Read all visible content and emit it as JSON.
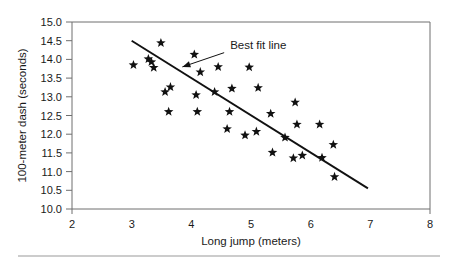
{
  "chart_data": {
    "type": "scatter",
    "title": "",
    "xlabel": "Long jump (meters)",
    "ylabel": "100-meter dash (seconds)",
    "xlim": [
      2,
      8
    ],
    "ylim": [
      10.0,
      15.0
    ],
    "xticks": [
      "2",
      "3",
      "4",
      "5",
      "6",
      "7",
      "8"
    ],
    "yticks": [
      "10.0",
      "10.5",
      "11.0",
      "11.5",
      "12.0",
      "12.5",
      "13.0",
      "13.5",
      "14.0",
      "14.5",
      "15.0"
    ],
    "grid": false,
    "legend": false,
    "marker_symbol": "star",
    "marker_color": "#111111",
    "series": [
      {
        "name": "Athletes",
        "points": [
          [
            3.03,
            13.85
          ],
          [
            3.28,
            14.01
          ],
          [
            3.33,
            13.93
          ],
          [
            3.37,
            13.78
          ],
          [
            3.49,
            14.44
          ],
          [
            3.56,
            13.13
          ],
          [
            3.62,
            12.6
          ],
          [
            3.65,
            13.26
          ],
          [
            4.05,
            14.13
          ],
          [
            4.08,
            13.05
          ],
          [
            4.1,
            12.6
          ],
          [
            4.15,
            13.66
          ],
          [
            4.39,
            13.13
          ],
          [
            4.45,
            13.8
          ],
          [
            4.6,
            12.14
          ],
          [
            4.64,
            12.6
          ],
          [
            4.68,
            13.22
          ],
          [
            4.9,
            11.97
          ],
          [
            4.97,
            13.79
          ],
          [
            5.09,
            12.07
          ],
          [
            5.12,
            13.24
          ],
          [
            5.33,
            12.55
          ],
          [
            5.36,
            11.51
          ],
          [
            5.57,
            11.91
          ],
          [
            5.71,
            11.36
          ],
          [
            5.74,
            12.85
          ],
          [
            5.77,
            12.26
          ],
          [
            5.86,
            11.43
          ],
          [
            6.15,
            12.26
          ],
          [
            6.19,
            11.37
          ],
          [
            6.38,
            11.72
          ],
          [
            6.4,
            10.86
          ]
        ]
      }
    ],
    "fit_line": {
      "label": "Best fit line",
      "x_start": 3.0,
      "y_start": 14.5,
      "x_end": 6.96,
      "y_end": 10.55
    },
    "annotation": {
      "text": "Best fit line",
      "arrow_from_x": 4.55,
      "arrow_from_y": 14.18,
      "arrow_to_x": 3.85,
      "arrow_to_y": 13.8
    }
  },
  "figure": {
    "axis_color": "#6e6e6e",
    "marker_color": "#111111",
    "line_color": "#111111",
    "background": "#ffffff",
    "footer_rule_color": "#9a9a9a"
  }
}
